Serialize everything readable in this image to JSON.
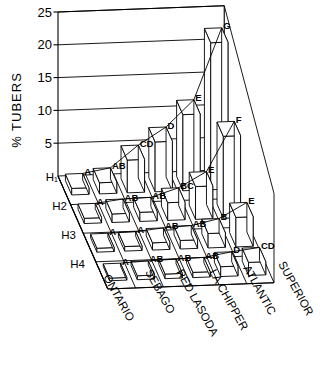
{
  "chart_data": {
    "type": "bar",
    "title": "",
    "subtitle": "",
    "xlabel": "",
    "ylabel": "% TUBERS",
    "zlabel": "",
    "ylim": [
      0,
      25
    ],
    "yticks": [
      0,
      5,
      10,
      15,
      20,
      25
    ],
    "ytick_labels": [
      "",
      "5",
      "10",
      "15",
      "20",
      "25"
    ],
    "grid": true,
    "legend": "none",
    "projection": "3d-isometric",
    "categories": [
      "ONTARIO",
      "SEBAGO",
      "RED LASODA",
      "LA CHIPPER",
      "ATLANTIC",
      "SUPERIOR"
    ],
    "rows": [
      "H1",
      "H2",
      "H3",
      "H4"
    ],
    "row_labels_display": [
      "H₁",
      "H2",
      "H3",
      "H4"
    ],
    "series": [
      {
        "name": "H1",
        "values": [
          1.0,
          1.7,
          5.0,
          7.6,
          11.6,
          22.4
        ],
        "labels": [
          "A",
          "AB",
          "CD",
          "D",
          "E",
          "G"
        ]
      },
      {
        "name": "H2",
        "values": [
          0.8,
          1.3,
          1.4,
          2.7,
          5.0,
          12.5
        ],
        "labels": [
          "A",
          "AB",
          "AB",
          "BC",
          "E",
          "F"
        ]
      },
      {
        "name": "H3",
        "values": [
          0.6,
          0.7,
          1.1,
          1.3,
          2.2,
          4.5
        ],
        "labels": [
          "A",
          "A",
          "AB",
          "AB",
          "B",
          "E"
        ]
      },
      {
        "name": "H4",
        "values": [
          0.4,
          0.6,
          0.7,
          0.8,
          1.5,
          2.0
        ],
        "labels": [
          "A",
          "AB",
          "AB",
          "AB",
          "D",
          "CD"
        ]
      }
    ]
  },
  "axis": {
    "y_title": "% TUBERS",
    "tick_25": "25",
    "tick_20": "20",
    "tick_15": "15",
    "tick_10": "10",
    "tick_5": "5",
    "h1": "H₁",
    "h2": "H2",
    "h3": "H3",
    "h4": "H4"
  },
  "cats": {
    "c0": "ONTARIO",
    "c1": "SEBAGO",
    "c2": "RED LASODA",
    "c3": "LA CHIPPER",
    "c4": "ATLANTIC",
    "c5": "SUPERIOR"
  },
  "sig_labels": {
    "h1": [
      "A",
      "AB",
      "CD",
      "D",
      "E",
      "G"
    ],
    "h2": [
      "A",
      "AB",
      "AB",
      "BC",
      "E",
      "F"
    ],
    "h3": [
      "A",
      "A",
      "AB",
      "AB",
      "B",
      "E"
    ],
    "h4": [
      "A",
      "AB",
      "AB",
      "AB",
      "D",
      "CD"
    ]
  },
  "colors": {
    "line": "#000000",
    "fill": "#ffffff",
    "background": "#ffffff"
  }
}
